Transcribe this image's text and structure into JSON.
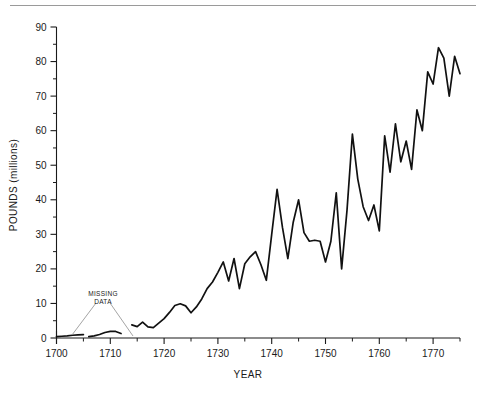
{
  "figure": {
    "background_color": "#ffffff",
    "line_color": "#111111",
    "axis_color": "#1a1a1a",
    "leader_color": "#8d8d8d",
    "page_rule_color": "#9a9a9a"
  },
  "annotations": [
    {
      "name": "missing-data",
      "line1": "MISSING",
      "line2": "DATA",
      "x_label": 103,
      "y_label": 296,
      "leaders": [
        {
          "x1": 96,
          "y1": 303,
          "x2": 72,
          "y2": 335
        },
        {
          "x1": 110,
          "y1": 303,
          "x2": 133,
          "y2": 336
        }
      ]
    }
  ],
  "chart_data": {
    "type": "line",
    "title": "",
    "subtitle": "",
    "xlabel": "YEAR",
    "ylabel": "POUNDS (millions)",
    "xlim": [
      1700,
      1775
    ],
    "ylim": [
      0,
      90
    ],
    "grid": false,
    "legend": "none",
    "x_major_ticks": [
      1700,
      1710,
      1720,
      1730,
      1740,
      1750,
      1760,
      1770
    ],
    "x_major_tick_labels": [
      "1700",
      "1710",
      "1720",
      "1730",
      "1740",
      "1750",
      "1760",
      "1770"
    ],
    "x_minor_ticks": [
      1705,
      1715,
      1725,
      1735,
      1745,
      1755,
      1765,
      1775
    ],
    "y_major_ticks": [
      0,
      10,
      20,
      30,
      40,
      50,
      60,
      70,
      80,
      90
    ],
    "y_major_tick_labels": [
      "0",
      "10",
      "20",
      "30",
      "40",
      "50",
      "60",
      "70",
      "80",
      "90"
    ],
    "y_minor_ticks": [
      5,
      15,
      25,
      35,
      45,
      55,
      65,
      75,
      85
    ],
    "series": [
      {
        "name": "tobacco-imports",
        "segments": [
          {
            "name": "segment-1700-1705",
            "points": [
              [
                1700,
                0.4
              ],
              [
                1701,
                0.5
              ],
              [
                1702,
                0.6
              ],
              [
                1703,
                0.8
              ],
              [
                1704,
                0.9
              ],
              [
                1705,
                1.0
              ]
            ]
          },
          {
            "name": "segment-1706-1712",
            "points": [
              [
                1706,
                0.4
              ],
              [
                1707,
                0.6
              ],
              [
                1708,
                1.0
              ],
              [
                1709,
                1.6
              ],
              [
                1710,
                1.9
              ],
              [
                1711,
                1.9
              ],
              [
                1712,
                1.3
              ]
            ]
          },
          {
            "name": "segment-1714-1775",
            "points": [
              [
                1714,
                3.8
              ],
              [
                1715,
                3.3
              ],
              [
                1716,
                4.6
              ],
              [
                1717,
                3.2
              ],
              [
                1718,
                3.0
              ],
              [
                1719,
                4.3
              ],
              [
                1720,
                5.6
              ],
              [
                1721,
                7.4
              ],
              [
                1722,
                9.4
              ],
              [
                1723,
                9.9
              ],
              [
                1724,
                9.3
              ],
              [
                1725,
                7.3
              ],
              [
                1726,
                9.0
              ],
              [
                1727,
                11.3
              ],
              [
                1728,
                14.3
              ],
              [
                1729,
                16.2
              ],
              [
                1730,
                19.0
              ],
              [
                1731,
                22.0
              ],
              [
                1732,
                16.5
              ],
              [
                1733,
                23.0
              ],
              [
                1734,
                14.3
              ],
              [
                1735,
                21.5
              ],
              [
                1736,
                23.5
              ],
              [
                1737,
                25.0
              ],
              [
                1738,
                21.2
              ],
              [
                1739,
                16.7
              ],
              [
                1740,
                30.0
              ],
              [
                1741,
                43.0
              ],
              [
                1742,
                32.0
              ],
              [
                1743,
                23.0
              ],
              [
                1744,
                33.5
              ],
              [
                1745,
                40.0
              ],
              [
                1746,
                30.5
              ],
              [
                1747,
                28.0
              ],
              [
                1748,
                28.3
              ],
              [
                1749,
                28.0
              ],
              [
                1750,
                22.0
              ],
              [
                1751,
                28.0
              ],
              [
                1752,
                42.0
              ],
              [
                1753,
                20.0
              ],
              [
                1754,
                37.0
              ],
              [
                1755,
                59.0
              ],
              [
                1756,
                46.0
              ],
              [
                1757,
                38.0
              ],
              [
                1758,
                34.0
              ],
              [
                1759,
                38.5
              ],
              [
                1760,
                31.0
              ],
              [
                1761,
                58.5
              ],
              [
                1762,
                48.0
              ],
              [
                1763,
                62.0
              ],
              [
                1764,
                51.0
              ],
              [
                1765,
                57.0
              ],
              [
                1766,
                48.8
              ],
              [
                1767,
                66.0
              ],
              [
                1768,
                60.0
              ],
              [
                1769,
                77.0
              ],
              [
                1770,
                73.5
              ],
              [
                1771,
                84.0
              ],
              [
                1772,
                81.0
              ],
              [
                1773,
                70.0
              ],
              [
                1774,
                81.5
              ],
              [
                1775,
                76.5
              ]
            ]
          }
        ]
      }
    ]
  }
}
